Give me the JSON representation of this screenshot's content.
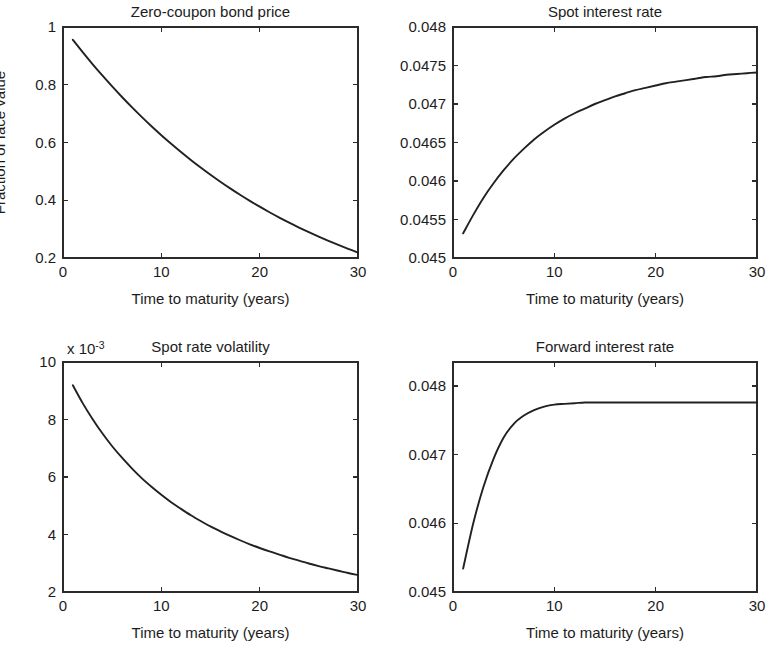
{
  "figure": {
    "layout": "2x2 subplot grid",
    "background": "#ffffff",
    "line_color": "#23211f",
    "axis_color": "#2b2b2b"
  },
  "chart_data": [
    {
      "id": "zero-coupon-bond-price",
      "type": "line",
      "title": "Zero-coupon bond price",
      "xlabel": "Time to maturity (years)",
      "ylabel": "Fraction of face value",
      "xlim": [
        0,
        30
      ],
      "ylim": [
        0.2,
        1
      ],
      "xticks": [
        0,
        10,
        20,
        30
      ],
      "xticklabels": [
        "0",
        "10",
        "20",
        "30"
      ],
      "yticks": [
        0.2,
        0.4,
        0.6,
        0.8,
        1
      ],
      "yticklabels": [
        "0.2",
        "0.4",
        "0.6",
        "0.8",
        "1"
      ],
      "grid": false,
      "legend": null,
      "exponent_label": null,
      "x": [
        1,
        2,
        3,
        4,
        5,
        6,
        7,
        8,
        9,
        10,
        11,
        12,
        13,
        14,
        15,
        16,
        17,
        18,
        19,
        20,
        21,
        22,
        23,
        24,
        25,
        26,
        27,
        28,
        29,
        30
      ],
      "y": [
        0.9557,
        0.9129,
        0.8717,
        0.8321,
        0.7941,
        0.7575,
        0.7224,
        0.6887,
        0.6563,
        0.6253,
        0.5955,
        0.567,
        0.5396,
        0.5134,
        0.4883,
        0.4642,
        0.4412,
        0.4191,
        0.398,
        0.3778,
        0.3585,
        0.34,
        0.3224,
        0.3055,
        0.2893,
        0.2739,
        0.2592,
        0.2451,
        0.2317,
        0.2189
      ]
    },
    {
      "id": "spot-interest-rate",
      "type": "line",
      "title": "Spot interest rate",
      "xlabel": "Time to maturity (years)",
      "ylabel": null,
      "xlim": [
        0,
        30
      ],
      "ylim": [
        0.045,
        0.048
      ],
      "xticks": [
        0,
        10,
        20,
        30
      ],
      "xticklabels": [
        "0",
        "10",
        "20",
        "30"
      ],
      "yticks": [
        0.045,
        0.0455,
        0.046,
        0.0465,
        0.047,
        0.0475,
        0.048
      ],
      "yticklabels": [
        "0.045",
        "0.0455",
        "0.046",
        "0.0465",
        "0.047",
        "0.0475",
        "0.048"
      ],
      "grid": false,
      "legend": null,
      "exponent_label": null,
      "x": [
        1,
        2,
        3,
        4,
        5,
        6,
        7,
        8,
        9,
        10,
        11,
        12,
        13,
        14,
        15,
        16,
        17,
        18,
        19,
        20,
        21,
        22,
        23,
        24,
        25,
        26,
        27,
        28,
        29,
        30
      ],
      "y": [
        0.04532,
        0.04556,
        0.04578,
        0.04597,
        0.04614,
        0.04629,
        0.04642,
        0.04654,
        0.04664,
        0.04673,
        0.04681,
        0.04688,
        0.04694,
        0.047,
        0.04705,
        0.0471,
        0.04714,
        0.04718,
        0.04721,
        0.04724,
        0.04727,
        0.04729,
        0.04731,
        0.04733,
        0.04735,
        0.04736,
        0.04738,
        0.04739,
        0.0474,
        0.04741
      ]
    },
    {
      "id": "spot-rate-volatility",
      "type": "line",
      "title": "Spot rate volatility",
      "xlabel": "Time to maturity (years)",
      "ylabel": null,
      "xlim": [
        0,
        30
      ],
      "ylim": [
        0.002,
        0.01
      ],
      "xticks": [
        0,
        10,
        20,
        30
      ],
      "xticklabels": [
        "0",
        "10",
        "20",
        "30"
      ],
      "yticks": [
        0.002,
        0.004,
        0.006,
        0.008,
        0.01
      ],
      "yticklabels": [
        "2",
        "4",
        "6",
        "8",
        "10"
      ],
      "grid": false,
      "legend": null,
      "exponent_label": "x 10",
      "exponent_value": "-3",
      "x": [
        1,
        2,
        3,
        4,
        5,
        6,
        7,
        8,
        9,
        10,
        11,
        12,
        13,
        14,
        15,
        16,
        17,
        18,
        19,
        20,
        21,
        22,
        23,
        24,
        25,
        26,
        27,
        28,
        29,
        30
      ],
      "y": [
        0.00919,
        0.00857,
        0.00802,
        0.00752,
        0.00707,
        0.00667,
        0.0063,
        0.00596,
        0.00566,
        0.00538,
        0.00512,
        0.00489,
        0.00467,
        0.00447,
        0.00428,
        0.00411,
        0.00395,
        0.0038,
        0.00366,
        0.00353,
        0.00341,
        0.0033,
        0.00319,
        0.00309,
        0.00299,
        0.0029,
        0.00282,
        0.00274,
        0.00266,
        0.00259
      ]
    },
    {
      "id": "forward-interest-rate",
      "type": "line",
      "title": "Forward interest rate",
      "xlabel": "Time to maturity (years)",
      "ylabel": null,
      "xlim": [
        0,
        30
      ],
      "ylim": [
        0.045,
        0.04835
      ],
      "xticks": [
        0,
        10,
        20,
        30
      ],
      "xticklabels": [
        "0",
        "10",
        "20",
        "30"
      ],
      "yticks": [
        0.045,
        0.046,
        0.047,
        0.048
      ],
      "yticklabels": [
        "0.045",
        "0.046",
        "0.047",
        "0.048"
      ],
      "grid": false,
      "legend": null,
      "exponent_label": null,
      "x": [
        1,
        2,
        3,
        4,
        5,
        6,
        7,
        8,
        9,
        10,
        11,
        12,
        13,
        14,
        15,
        16,
        17,
        18,
        19,
        20,
        21,
        22,
        23,
        24,
        25,
        26,
        27,
        28,
        29,
        30
      ],
      "y": [
        0.04534,
        0.046,
        0.04653,
        0.04694,
        0.04725,
        0.04745,
        0.04757,
        0.04765,
        0.0477,
        0.04773,
        0.04774,
        0.04775,
        0.04776,
        0.04776,
        0.04776,
        0.04776,
        0.04776,
        0.04776,
        0.04776,
        0.04776,
        0.04776,
        0.04776,
        0.04776,
        0.04776,
        0.04776,
        0.04776,
        0.04776,
        0.04776,
        0.04776,
        0.04776
      ]
    }
  ]
}
